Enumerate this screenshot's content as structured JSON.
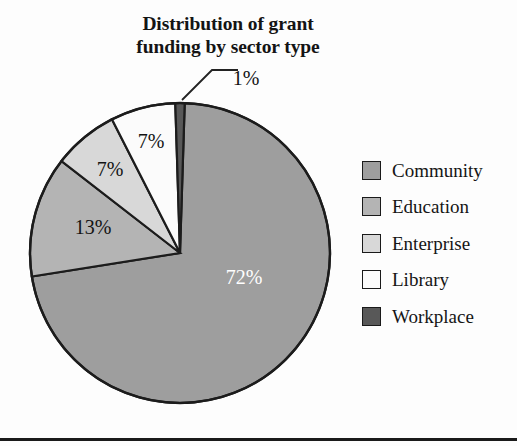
{
  "title": {
    "line1": "Distribution of grant",
    "line2": "funding by sector type",
    "full": "Distribution of grant funding by sector type"
  },
  "legend": {
    "items": [
      {
        "label": "Community",
        "color": "#9e9e9e",
        "value": 72
      },
      {
        "label": "Education",
        "color": "#b4b4b4",
        "value": 13
      },
      {
        "label": "Enterprise",
        "color": "#d8d8d8",
        "value": 7
      },
      {
        "label": "Library",
        "color": "#fbfbfb",
        "value": 7
      },
      {
        "label": "Workplace",
        "color": "#585858",
        "value": 1
      }
    ]
  },
  "labels": {
    "workplace": "1%",
    "community": "72%",
    "education": "13%",
    "enterprise": "7%",
    "library": "7%"
  },
  "chart_data": {
    "type": "pie",
    "title": "Distribution of grant funding by sector type",
    "categories": [
      "Community",
      "Education",
      "Enterprise",
      "Library",
      "Workplace"
    ],
    "values": [
      72,
      13,
      7,
      7,
      1
    ],
    "value_labels": [
      "72%",
      "13%",
      "7%",
      "7%",
      "1%"
    ],
    "units": "percent",
    "colors": [
      "#9e9e9e",
      "#b4b4b4",
      "#d8d8d8",
      "#fbfbfb",
      "#585858"
    ],
    "legend_position": "right",
    "start_angle_deg": 0,
    "direction": "clockwise",
    "slice_order_clockwise_from_12": [
      "Workplace",
      "Community",
      "Education",
      "Enterprise",
      "Library"
    ],
    "grid": false,
    "xlabel": "",
    "ylabel": ""
  }
}
